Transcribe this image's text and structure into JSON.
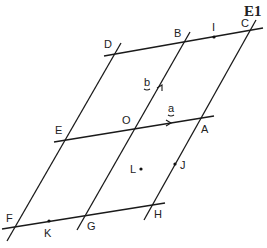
{
  "figure": {
    "id_label": "E1",
    "lines": {
      "horizontal": [
        {
          "name": "line-DC",
          "from": [
            104,
            56
          ],
          "to": [
            263,
            28
          ]
        },
        {
          "name": "line-EA",
          "from": [
            54,
            142
          ],
          "to": [
            214,
            116
          ]
        },
        {
          "name": "line-FH",
          "from": [
            2,
            229
          ],
          "to": [
            165,
            203
          ]
        }
      ],
      "slanted": [
        {
          "name": "line-DF",
          "from": [
            121,
            43
          ],
          "to": [
            7,
            241
          ]
        },
        {
          "name": "line-BG",
          "from": [
            190,
            32
          ],
          "to": [
            77,
            230
          ]
        },
        {
          "name": "line-CH",
          "from": [
            256,
            20
          ],
          "to": [
            144,
            220
          ]
        }
      ]
    },
    "points": [
      {
        "label": "D",
        "x": 116,
        "y": 53,
        "lx": 104,
        "ly": 48
      },
      {
        "label": "B",
        "x": 184,
        "y": 42,
        "lx": 174,
        "ly": 37
      },
      {
        "label": "I",
        "x": 214,
        "y": 37,
        "lx": 212,
        "ly": 31,
        "dot": true
      },
      {
        "label": "C",
        "x": 250,
        "y": 31,
        "lx": 241,
        "ly": 27
      },
      {
        "label": "E",
        "x": 67,
        "y": 139,
        "lx": 55,
        "ly": 134
      },
      {
        "label": "O",
        "x": 135,
        "y": 128,
        "lx": 122,
        "ly": 124
      },
      {
        "label": "A",
        "x": 200,
        "y": 119,
        "lx": 201,
        "ly": 133
      },
      {
        "label": "L",
        "x": 141,
        "y": 169,
        "lx": 130,
        "ly": 173,
        "dot": true
      },
      {
        "label": "J",
        "x": 175,
        "y": 164,
        "lx": 180,
        "ly": 169,
        "dot": true
      },
      {
        "label": "F",
        "x": 15,
        "y": 226,
        "lx": 6,
        "ly": 222
      },
      {
        "label": "K",
        "x": 49,
        "y": 221,
        "lx": 44,
        "ly": 237,
        "dot": true
      },
      {
        "label": "G",
        "x": 84,
        "y": 216,
        "lx": 87,
        "ly": 230
      },
      {
        "label": "H",
        "x": 152,
        "y": 206,
        "lx": 154,
        "ly": 218
      }
    ],
    "vectors": [
      {
        "label": "a",
        "lx": 168,
        "ly": 113
      },
      {
        "label": "b",
        "lx": 144,
        "ly": 86
      }
    ]
  }
}
